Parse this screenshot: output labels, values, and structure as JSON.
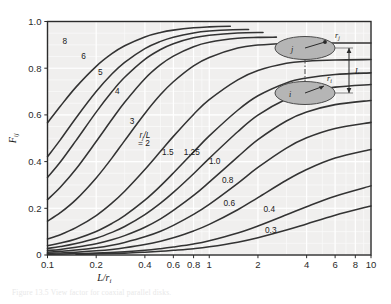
{
  "figure": {
    "caption": "Figure 13.5  View factor for coaxial parallel disks."
  },
  "axes": {
    "x_title": "L/r",
    "x_title_sub": "i",
    "y_title": "F",
    "y_title_sub": "ij",
    "x_ticks": [
      {
        "value": 0.1,
        "label": "0.1"
      },
      {
        "value": 0.2,
        "label": "0.2"
      },
      {
        "value": 0.4,
        "label": "0.4"
      },
      {
        "value": 0.6,
        "label": "0.6"
      },
      {
        "value": 0.8,
        "label": "0.8"
      },
      {
        "value": 1.0,
        "label": "1"
      },
      {
        "value": 2.0,
        "label": "2"
      },
      {
        "value": 4.0,
        "label": "4"
      },
      {
        "value": 6.0,
        "label": "6"
      },
      {
        "value": 8.0,
        "label": "8"
      },
      {
        "value": 10.0,
        "label": "10"
      }
    ],
    "y_ticks": [
      {
        "value": 0.0,
        "label": "0"
      },
      {
        "value": 0.2,
        "label": "0.2"
      },
      {
        "value": 0.4,
        "label": "0.4"
      },
      {
        "value": 0.6,
        "label": "0.6"
      },
      {
        "value": 0.8,
        "label": "0.8"
      },
      {
        "value": 1.0,
        "label": "1.0"
      }
    ],
    "minor_x_decades": [
      0.1,
      1.0
    ],
    "minor_y_step": 0.05
  },
  "inset": {
    "upper_disk_label": "j",
    "lower_disk_label": "i",
    "upper_radius_label": "r",
    "upper_radius_sub": "j",
    "lower_radius_label": "r",
    "lower_radius_sub": "i",
    "separation_label": "L",
    "disk_fill": "#b5b5b5",
    "disk_stroke": "#4a4a4a"
  },
  "parameter_legend": {
    "symbol_numerator": "r",
    "symbol_sub": "j",
    "symbol_denominator": "L",
    "text_line1": "r /L",
    "text_line2": "= 2"
  },
  "colors": {
    "plot_background": "#f0efee",
    "grid_major": "#ffffff",
    "grid_minor": "#fbfbfa",
    "frame": "#2b2b2b",
    "curve": "#333333",
    "tick_text": "#2a2a2a"
  },
  "chart_data": {
    "type": "line",
    "title": "View factor for coaxial parallel disks",
    "xlabel": "L/r_i",
    "ylabel": "F_ij",
    "xscale": "log",
    "yscale": "linear",
    "xlim": [
      0.1,
      10
    ],
    "ylim": [
      0,
      1.0
    ],
    "grid": true,
    "legend": "inline curve labels (r_j/L parameter)",
    "parameter_name": "r_j/L",
    "series": [
      {
        "name": "8",
        "param": 8.0,
        "label": "8",
        "label_x": 0.128,
        "label_y": 0.905,
        "x_end": 1.35,
        "values": [
          [
            0.1,
            0.566
          ],
          [
            0.12,
            0.637
          ],
          [
            0.15,
            0.719
          ],
          [
            0.2,
            0.808
          ],
          [
            0.25,
            0.862
          ],
          [
            0.3,
            0.896
          ],
          [
            0.4,
            0.934
          ],
          [
            0.5,
            0.953
          ],
          [
            0.6,
            0.963
          ],
          [
            0.8,
            0.973
          ],
          [
            1.0,
            0.977
          ],
          [
            1.35,
            0.98
          ]
        ]
      },
      {
        "name": "6",
        "param": 6.0,
        "label": "6",
        "label_x": 0.167,
        "label_y": 0.838,
        "x_end": 1.75,
        "values": [
          [
            0.1,
            0.421
          ],
          [
            0.12,
            0.493
          ],
          [
            0.15,
            0.587
          ],
          [
            0.2,
            0.7
          ],
          [
            0.25,
            0.775
          ],
          [
            0.3,
            0.825
          ],
          [
            0.4,
            0.884
          ],
          [
            0.5,
            0.915
          ],
          [
            0.6,
            0.933
          ],
          [
            0.8,
            0.951
          ],
          [
            1.0,
            0.959
          ],
          [
            1.4,
            0.965
          ],
          [
            1.75,
            0.966
          ]
        ]
      },
      {
        "name": "5",
        "param": 5.0,
        "label": "5",
        "label_x": 0.212,
        "label_y": 0.77,
        "x_end": 2.15,
        "values": [
          [
            0.1,
            0.332
          ],
          [
            0.12,
            0.398
          ],
          [
            0.15,
            0.49
          ],
          [
            0.2,
            0.612
          ],
          [
            0.25,
            0.699
          ],
          [
            0.3,
            0.761
          ],
          [
            0.4,
            0.838
          ],
          [
            0.5,
            0.88
          ],
          [
            0.6,
            0.905
          ],
          [
            0.8,
            0.93
          ],
          [
            1.0,
            0.941
          ],
          [
            1.5,
            0.951
          ],
          [
            2.15,
            0.953
          ]
        ]
      },
      {
        "name": "4",
        "param": 4.0,
        "label": "4",
        "label_x": 0.27,
        "label_y": 0.69,
        "x_end": 2.6,
        "values": [
          [
            0.1,
            0.237
          ],
          [
            0.12,
            0.29
          ],
          [
            0.15,
            0.368
          ],
          [
            0.2,
            0.486
          ],
          [
            0.25,
            0.58
          ],
          [
            0.3,
            0.654
          ],
          [
            0.4,
            0.755
          ],
          [
            0.5,
            0.815
          ],
          [
            0.6,
            0.852
          ],
          [
            0.8,
            0.892
          ],
          [
            1.0,
            0.911
          ],
          [
            1.5,
            0.928
          ],
          [
            2.0,
            0.932
          ],
          [
            2.6,
            0.933
          ]
        ]
      },
      {
        "name": "3",
        "param": 3.0,
        "label": "3",
        "label_x": 0.333,
        "label_y": 0.56,
        "x_end": 10,
        "values": [
          [
            0.1,
            0.145
          ],
          [
            0.12,
            0.181
          ],
          [
            0.15,
            0.237
          ],
          [
            0.2,
            0.33
          ],
          [
            0.25,
            0.415
          ],
          [
            0.3,
            0.49
          ],
          [
            0.4,
            0.606
          ],
          [
            0.5,
            0.687
          ],
          [
            0.6,
            0.742
          ],
          [
            0.8,
            0.81
          ],
          [
            1.0,
            0.846
          ],
          [
            1.5,
            0.886
          ],
          [
            2.0,
            0.899
          ],
          [
            3.0,
            0.906
          ],
          [
            5.0,
            0.908
          ],
          [
            10,
            0.908
          ]
        ]
      },
      {
        "name": "2",
        "param": 2.0,
        "label": "2",
        "label_x": 0.425,
        "label_y": 0.43,
        "x_end": 10,
        "values": [
          [
            0.1,
            0.069
          ],
          [
            0.12,
            0.087
          ],
          [
            0.15,
            0.117
          ],
          [
            0.2,
            0.169
          ],
          [
            0.25,
            0.222
          ],
          [
            0.3,
            0.273
          ],
          [
            0.4,
            0.366
          ],
          [
            0.5,
            0.444
          ],
          [
            0.6,
            0.508
          ],
          [
            0.8,
            0.602
          ],
          [
            1.0,
            0.665
          ],
          [
            1.5,
            0.75
          ],
          [
            2.0,
            0.79
          ],
          [
            3.0,
            0.821
          ],
          [
            4.0,
            0.83
          ],
          [
            6.0,
            0.835
          ],
          [
            10,
            0.837
          ]
        ]
      },
      {
        "name": "1.5",
        "param": 1.5,
        "label": "1.5",
        "label_x": 0.555,
        "label_y": 0.43,
        "x_end": 10,
        "values": [
          [
            0.1,
            0.04
          ],
          [
            0.12,
            0.051
          ],
          [
            0.15,
            0.069
          ],
          [
            0.2,
            0.101
          ],
          [
            0.25,
            0.135
          ],
          [
            0.3,
            0.169
          ],
          [
            0.4,
            0.235
          ],
          [
            0.5,
            0.296
          ],
          [
            0.6,
            0.351
          ],
          [
            0.8,
            0.441
          ],
          [
            1.0,
            0.51
          ],
          [
            1.5,
            0.62
          ],
          [
            2.0,
            0.682
          ],
          [
            3.0,
            0.737
          ],
          [
            4.0,
            0.758
          ],
          [
            6.0,
            0.773
          ],
          [
            10,
            0.78
          ]
        ]
      },
      {
        "name": "1.25",
        "param": 1.25,
        "label": "1.25",
        "label_x": 0.78,
        "label_y": 0.43,
        "x_end": 10,
        "values": [
          [
            0.1,
            0.028
          ],
          [
            0.12,
            0.036
          ],
          [
            0.15,
            0.049
          ],
          [
            0.2,
            0.072
          ],
          [
            0.25,
            0.097
          ],
          [
            0.3,
            0.122
          ],
          [
            0.4,
            0.173
          ],
          [
            0.5,
            0.222
          ],
          [
            0.6,
            0.268
          ],
          [
            0.8,
            0.348
          ],
          [
            1.0,
            0.414
          ],
          [
            1.5,
            0.528
          ],
          [
            2.0,
            0.599
          ],
          [
            3.0,
            0.668
          ],
          [
            4.0,
            0.697
          ],
          [
            6.0,
            0.719
          ],
          [
            10,
            0.73
          ]
        ]
      },
      {
        "name": "1.0",
        "param": 1.0,
        "label": "1.0",
        "label_x": 1.08,
        "label_y": 0.39,
        "x_end": 10,
        "values": [
          [
            0.1,
            0.019
          ],
          [
            0.12,
            0.024
          ],
          [
            0.15,
            0.033
          ],
          [
            0.2,
            0.048
          ],
          [
            0.25,
            0.065
          ],
          [
            0.3,
            0.083
          ],
          [
            0.4,
            0.119
          ],
          [
            0.5,
            0.155
          ],
          [
            0.6,
            0.191
          ],
          [
            0.8,
            0.255
          ],
          [
            1.0,
            0.312
          ],
          [
            1.5,
            0.42
          ],
          [
            2.0,
            0.494
          ],
          [
            3.0,
            0.574
          ],
          [
            4.0,
            0.612
          ],
          [
            6.0,
            0.644
          ],
          [
            10,
            0.662
          ]
        ]
      },
      {
        "name": "0.8",
        "param": 0.8,
        "label": "0.8",
        "label_x": 1.3,
        "label_y": 0.31,
        "x_end": 10,
        "values": [
          [
            0.1,
            0.012
          ],
          [
            0.12,
            0.016
          ],
          [
            0.15,
            0.021
          ],
          [
            0.2,
            0.031
          ],
          [
            0.25,
            0.042
          ],
          [
            0.3,
            0.054
          ],
          [
            0.4,
            0.078
          ],
          [
            0.5,
            0.102
          ],
          [
            0.6,
            0.127
          ],
          [
            0.8,
            0.174
          ],
          [
            1.0,
            0.217
          ],
          [
            1.5,
            0.307
          ],
          [
            2.0,
            0.375
          ],
          [
            3.0,
            0.458
          ],
          [
            4.0,
            0.502
          ],
          [
            6.0,
            0.542
          ],
          [
            10,
            0.568
          ]
        ]
      },
      {
        "name": "0.6",
        "param": 0.6,
        "label": "0.6",
        "label_x": 1.33,
        "label_y": 0.21,
        "x_end": 10,
        "values": [
          [
            0.1,
            0.007
          ],
          [
            0.12,
            0.009
          ],
          [
            0.15,
            0.012
          ],
          [
            0.2,
            0.018
          ],
          [
            0.25,
            0.024
          ],
          [
            0.3,
            0.031
          ],
          [
            0.4,
            0.045
          ],
          [
            0.5,
            0.059
          ],
          [
            0.6,
            0.074
          ],
          [
            0.8,
            0.103
          ],
          [
            1.0,
            0.131
          ],
          [
            1.5,
            0.194
          ],
          [
            2.0,
            0.246
          ],
          [
            3.0,
            0.32
          ],
          [
            4.0,
            0.366
          ],
          [
            6.0,
            0.415
          ],
          [
            10,
            0.452
          ]
        ]
      },
      {
        "name": "0.4",
        "param": 0.4,
        "label": "0.4",
        "label_x": 2.35,
        "label_y": 0.185,
        "x_end": 10,
        "values": [
          [
            0.1,
            0.003
          ],
          [
            0.15,
            0.006
          ],
          [
            0.2,
            0.008
          ],
          [
            0.3,
            0.014
          ],
          [
            0.4,
            0.02
          ],
          [
            0.5,
            0.027
          ],
          [
            0.6,
            0.034
          ],
          [
            0.8,
            0.047
          ],
          [
            1.0,
            0.061
          ],
          [
            1.5,
            0.094
          ],
          [
            2.0,
            0.124
          ],
          [
            3.0,
            0.172
          ],
          [
            4.0,
            0.207
          ],
          [
            6.0,
            0.252
          ],
          [
            10,
            0.296
          ]
        ]
      },
      {
        "name": "0.3",
        "param": 0.3,
        "label": "0.3",
        "label_x": 2.4,
        "label_y": 0.095,
        "x_end": 10,
        "values": [
          [
            0.15,
            0.003
          ],
          [
            0.2,
            0.005
          ],
          [
            0.3,
            0.008
          ],
          [
            0.4,
            0.012
          ],
          [
            0.5,
            0.016
          ],
          [
            0.6,
            0.02
          ],
          [
            0.8,
            0.027
          ],
          [
            1.0,
            0.035
          ],
          [
            1.5,
            0.055
          ],
          [
            2.0,
            0.074
          ],
          [
            3.0,
            0.107
          ],
          [
            4.0,
            0.133
          ],
          [
            6.0,
            0.17
          ],
          [
            10,
            0.21
          ]
        ]
      }
    ]
  }
}
